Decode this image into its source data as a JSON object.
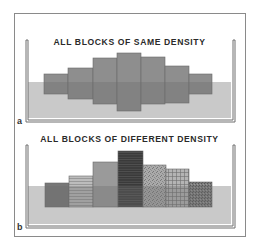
{
  "figure": {
    "panels": [
      {
        "label": "a",
        "title": "ALL BLOCKS OF SAME DENSITY",
        "container": {
          "left": 26,
          "right": 233,
          "top": 40,
          "bottom": 120,
          "fluid_top": 82
        },
        "blocks": [
          {
            "x": 44,
            "w": 24,
            "top": 74,
            "bottom": 94,
            "color": "#8e8e8e"
          },
          {
            "x": 68,
            "w": 25,
            "top": 68,
            "bottom": 99,
            "color": "#8e8e8e"
          },
          {
            "x": 93,
            "w": 24,
            "top": 58,
            "bottom": 104,
            "color": "#8e8e8e"
          },
          {
            "x": 117,
            "w": 24,
            "top": 53,
            "bottom": 111,
            "color": "#8e8e8e"
          },
          {
            "x": 141,
            "w": 24,
            "top": 57,
            "bottom": 104,
            "color": "#8e8e8e"
          },
          {
            "x": 165,
            "w": 24,
            "top": 66,
            "bottom": 103,
            "color": "#8e8e8e"
          },
          {
            "x": 189,
            "w": 23,
            "top": 74,
            "bottom": 94,
            "color": "#8e8e8e"
          }
        ]
      },
      {
        "label": "b",
        "title": "ALL BLOCKS OF DIFFERENT DENSITY",
        "container": {
          "left": 26,
          "right": 233,
          "top": 145,
          "bottom": 226,
          "fluid_top": 186
        },
        "blocks": [
          {
            "x": 45,
            "w": 24,
            "top": 183,
            "bottom": 207,
            "color": "#777777",
            "pattern": "solid"
          },
          {
            "x": 69,
            "w": 24,
            "top": 176,
            "bottom": 207,
            "color": "#b8b8b8",
            "pattern": "lines"
          },
          {
            "x": 93,
            "w": 25,
            "top": 162,
            "bottom": 207,
            "color": "#9a9a9a",
            "pattern": "solid"
          },
          {
            "x": 118,
            "w": 25,
            "top": 151,
            "bottom": 207,
            "color": "#3e3e3e",
            "pattern": "lines-dark"
          },
          {
            "x": 143,
            "w": 23,
            "top": 165,
            "bottom": 207,
            "color": "#a6a6a6",
            "pattern": "speckle"
          },
          {
            "x": 166,
            "w": 23,
            "top": 169,
            "bottom": 207,
            "color": "#b0b0b0",
            "pattern": "grid"
          },
          {
            "x": 189,
            "w": 23,
            "top": 182,
            "bottom": 207,
            "color": "#7a7a7a",
            "pattern": "speckle-dark"
          }
        ]
      }
    ],
    "colors": {
      "fluid": "#c9c9c9",
      "wall": "#6f6f6f",
      "frame": "#8a8a8a",
      "submerged_overlay": "rgba(110,110,110,0.35)"
    }
  }
}
